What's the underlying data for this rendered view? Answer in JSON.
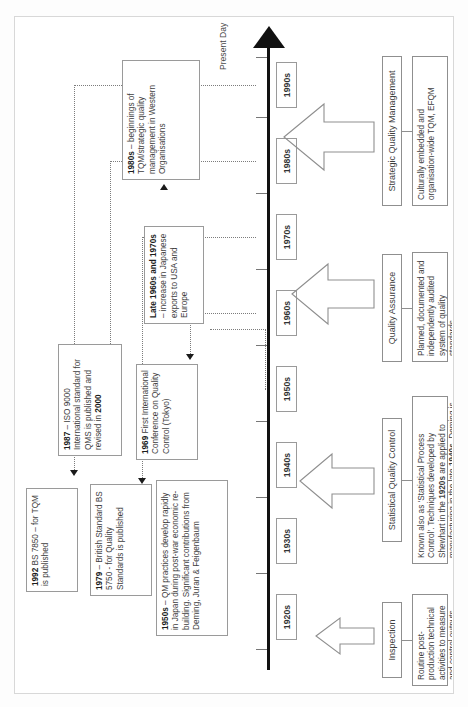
{
  "diagram": {
    "axis_end_label": "Present Day",
    "orientation": "rotated-90-ccw"
  },
  "timeline": {
    "decades": [
      {
        "label": "1920s"
      },
      {
        "label": "1930s"
      },
      {
        "label": "1940s"
      },
      {
        "label": "1950s"
      },
      {
        "label": "1960s"
      },
      {
        "label": "1970s"
      },
      {
        "label": "1980s"
      },
      {
        "label": "1990s"
      }
    ]
  },
  "notes": [
    {
      "id": "note-1950s",
      "lead": "1950s",
      "text": " – QM practices develop rapidly in Japan during post-war economic re-building. Significant contributions from Deming, Juran & Feigenbaum"
    },
    {
      "id": "note-1969",
      "lead": "1969",
      "text": " First International Conference on Quality Control (Tokyo)"
    },
    {
      "id": "note-1979",
      "lead": "1979",
      "text": " – British Standard BS 5750 - for Quality Standards is published"
    },
    {
      "id": "note-1987",
      "lead": "1987",
      "text": " – ISO 9000 International standard for QMS is published and revised in ",
      "tail_bold": "2000"
    },
    {
      "id": "note-1992",
      "lead": "1992",
      "text": " BS 7850 – for TQM is published"
    },
    {
      "id": "note-late1960s",
      "lead": "Late 1960s and 1970s",
      "text": " – increase in Japanese exports to USA and Europe"
    },
    {
      "id": "note-1980s",
      "lead": "1980s",
      "text": "  – beginnings of TQM/strategic quality management in Western Organisations"
    }
  ],
  "stages": [
    {
      "id": "stage-inspection",
      "label": "Inspection",
      "description": "Routine post-production technical activities to measure and control outputs"
    },
    {
      "id": "stage-sqc",
      "label": "Statistical Quality Control",
      "description_parts": {
        "a": "Known also as ‘Statistical Process Control’. Techniques developed by Shewhart in the ",
        "b1": "1920s",
        "c": " are applied to manufacturing in the late ",
        "b2": "1940s",
        "d": ". Deming is a leading proponent."
      }
    },
    {
      "id": "stage-qa",
      "label": "Quality Assurance",
      "description": "Planned, documented and independently audited system of quality standards."
    },
    {
      "id": "stage-sqm",
      "label": "Strategic Quality Management",
      "description": "Culturally embedded and organisation-wide TQM, EFQM"
    }
  ],
  "colors": {
    "axis": "#111111",
    "box_border": "#9a9a9a",
    "leader": "#7c7c7c",
    "text": "#3e3e3e",
    "page": "#ffffff"
  }
}
